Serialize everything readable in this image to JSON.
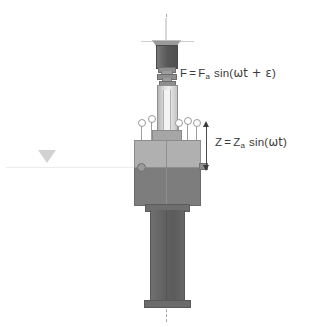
{
  "figure": {
    "background_color": "#ffffff"
  },
  "annotations": {
    "force_formula": {
      "label_full": "F = Fa sin(ωt + ε)",
      "lhs": "F",
      "equals": "=",
      "amplitude_symbol": "F",
      "amplitude_subscript": "a",
      "function": "sin(",
      "argument": "ωt + ε",
      "close": ")"
    },
    "displacement_formula": {
      "label_full": "Z = Za sin(ωt)",
      "lhs": "Z",
      "equals": "=",
      "amplitude_symbol": "Z",
      "amplitude_subscript": "a",
      "function": "sin(",
      "argument": "ωt",
      "close": ")"
    }
  },
  "components": {
    "centerline": "vertical-dashed-axis",
    "ground_reference": "ground-triangle-marker",
    "top_rod": "upper-guide-rod",
    "top_disc": "exciter-top-plate",
    "exciter_body": "electrodynamic-exciter-body",
    "connector": "force-transducer-connector",
    "shaft": "push-rod-shaft",
    "sensors": "accelerometer-pins",
    "specimen_block_upper": "specimen-upper-half",
    "specimen_block_lower": "specimen-lower-half",
    "column": "support-column",
    "dimension_arrow": "displacement-dimension-arrow"
  },
  "colors": {
    "background": "#ffffff",
    "exciter_dark": "#5f5f5f",
    "block_upper_gray": "#b0b0b0",
    "block_lower_gray": "#7d7d7d",
    "column_gray": "#616161",
    "centerline_gray": "#a8a8a8",
    "text_gray": "#3b3b3b",
    "ground_marker_gray": "#d2d2d2"
  },
  "sensor_count": 5
}
